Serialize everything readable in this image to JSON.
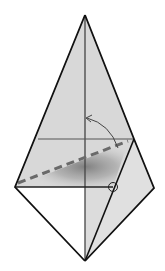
{
  "diagram": {
    "type": "origami-step",
    "colors": {
      "paper_fill": "#d6d6d6",
      "paper_light": "#e4e4e4",
      "white_face": "#ffffff",
      "outline": "#111111",
      "crease": "#444444",
      "dashed_fold": "#666666",
      "shadow": "#8a8a8a"
    },
    "vertices": {
      "top_apex": [
        85,
        15
      ],
      "bottom_apex": [
        85,
        261
      ],
      "left_point": [
        15,
        187
      ],
      "right_point": [
        154,
        188
      ],
      "right_edge_upper": [
        134,
        139
      ],
      "reference_circle": [
        113,
        187
      ]
    },
    "elements": [
      {
        "name": "center-crease",
        "kind": "line"
      },
      {
        "name": "horizontal-crease",
        "kind": "line"
      },
      {
        "name": "valley-fold-dashed",
        "kind": "dashed-line"
      },
      {
        "name": "fold-arrow",
        "kind": "curved-arrow"
      },
      {
        "name": "reference-circle",
        "kind": "circle-marker"
      }
    ]
  }
}
